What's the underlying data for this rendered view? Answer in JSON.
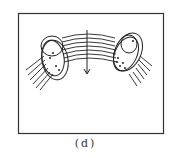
{
  "figure": {
    "caption": "(d)",
    "stroke_color": "#222222",
    "frame_color": "#333333",
    "elements": {
      "frame": "rectangular-border",
      "fiber_bundle": "curved-parallel-lines",
      "arrow": "downward-arrow",
      "left_ring": "tilted-elliptical-loop-with-dots",
      "right_ring": "tilted-elliptical-loop-with-dots"
    }
  }
}
